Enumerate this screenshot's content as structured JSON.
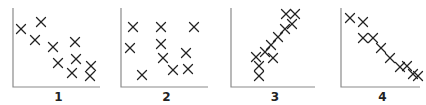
{
  "figure": {
    "width": 426,
    "height": 105,
    "colors": {
      "axis": "#8a8a8a",
      "marker": "#222222",
      "label": "#222222",
      "background": "#ffffff"
    },
    "marker_symbol": "x",
    "marker_half_size": 4.5
  },
  "chart_data": [
    {
      "type": "scatter",
      "title": "",
      "label": "1",
      "description": "weak/moderate negative correlation",
      "xlabel": "",
      "ylabel": "",
      "axes": {
        "x0": 13,
        "y0": 87,
        "x1": 100,
        "ytop": 8
      },
      "points": [
        [
          21,
          29
        ],
        [
          41,
          22
        ],
        [
          35,
          40
        ],
        [
          53,
          47
        ],
        [
          75,
          42
        ],
        [
          58,
          63
        ],
        [
          76,
          59
        ],
        [
          72,
          73
        ],
        [
          91,
          66
        ],
        [
          90,
          76
        ]
      ]
    },
    {
      "type": "scatter",
      "title": "",
      "label": "2",
      "description": "no correlation",
      "xlabel": "",
      "ylabel": "",
      "axes": {
        "x0": 121,
        "y0": 87,
        "x1": 208,
        "ytop": 8
      },
      "points": [
        [
          133,
          27
        ],
        [
          161,
          27
        ],
        [
          194,
          27
        ],
        [
          130,
          48
        ],
        [
          161,
          44
        ],
        [
          163,
          58
        ],
        [
          186,
          53
        ],
        [
          173,
          70
        ],
        [
          188,
          69
        ],
        [
          142,
          75
        ]
      ]
    },
    {
      "type": "scatter",
      "title": "",
      "label": "3",
      "description": "strong positive correlation",
      "xlabel": "",
      "ylabel": "",
      "axes": {
        "x0": 231,
        "y0": 87,
        "x1": 315,
        "ytop": 8
      },
      "points": [
        [
          286,
          14
        ],
        [
          295,
          14
        ],
        [
          292,
          24
        ],
        [
          285,
          29
        ],
        [
          278,
          37
        ],
        [
          271,
          45
        ],
        [
          265,
          52
        ],
        [
          256,
          57
        ],
        [
          273,
          58
        ],
        [
          259,
          66
        ],
        [
          259,
          76
        ]
      ]
    },
    {
      "type": "scatter",
      "title": "",
      "label": "4",
      "description": "strong negative correlation",
      "xlabel": "",
      "ylabel": "",
      "axes": {
        "x0": 341,
        "y0": 87,
        "x1": 420,
        "ytop": 8
      },
      "points": [
        [
          350,
          18
        ],
        [
          363,
          22
        ],
        [
          363,
          38
        ],
        [
          373,
          38
        ],
        [
          381,
          48
        ],
        [
          390,
          58
        ],
        [
          400,
          67
        ],
        [
          407,
          66
        ],
        [
          413,
          74
        ],
        [
          418,
          76
        ]
      ]
    }
  ]
}
